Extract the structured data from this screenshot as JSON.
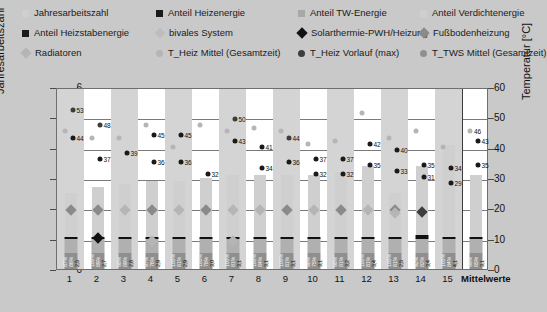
{
  "legend": {
    "rows": [
      [
        {
          "label": "Jahresarbeitszahl",
          "marker": "square",
          "color": "#cfcfcf",
          "name": "legend-jahresarbeitszahl"
        },
        {
          "label": "Anteil Heizenergie",
          "marker": "square",
          "color": "#1a1a1a",
          "name": "legend-anteil-heizenergie"
        },
        {
          "label": "Anteil TW-Energie",
          "marker": "square",
          "color": "#a8a8a8",
          "name": "legend-anteil-tw-energie"
        },
        {
          "label": "Anteil Verdichtenergie",
          "marker": "square",
          "color": "#cfcfcf",
          "name": "legend-anteil-verdichtenergie"
        }
      ],
      [
        {
          "label": "Anteil Heizstabenergie",
          "marker": "square",
          "color": "#1a1a1a",
          "name": "legend-anteil-heizstabenergie"
        },
        {
          "label": "bivales System",
          "marker": "diamond",
          "color": "#bdbdbd",
          "name": "legend-bivales-system"
        },
        {
          "label": "Solarthermie-PWH/Heizung",
          "marker": "diamond",
          "color": "#111111",
          "name": "legend-solarthermie"
        },
        {
          "label": "Fußbodenheizung",
          "marker": "diamond",
          "color": "#8a8a8a",
          "name": "legend-fussbodenheizung"
        }
      ],
      [
        {
          "label": "Radiatoren",
          "marker": "diamond",
          "color": "#b5b5b5",
          "name": "legend-radiatoren"
        },
        {
          "label": "T_Heiz Mittel (Gesamtzeit)",
          "marker": "circle",
          "color": "#b5b5b5",
          "name": "legend-t-heiz-mittel"
        },
        {
          "label": "T_Heiz Vorlauf (max)",
          "marker": "circle",
          "color": "#3d3d3d",
          "name": "legend-t-heiz-vorlauf-max"
        },
        {
          "label": "T_TWS Mittel (Gesamtzeit)",
          "marker": "circle",
          "color": "#8f8f8f",
          "name": "legend-t-tws-mittel"
        }
      ]
    ]
  },
  "axes": {
    "left_title": "Jahresarbeitszahl",
    "right_title": "Temperatur [°C]",
    "left_ticks": [
      "0",
      "1",
      "2",
      "3",
      "4",
      "5",
      "6"
    ],
    "right_ticks": [
      "0",
      "10",
      "20",
      "30",
      "40",
      "50",
      "60"
    ],
    "left_range": [
      0,
      6
    ],
    "right_range": [
      0,
      60
    ]
  },
  "chart_data": {
    "type": "bar",
    "title": "",
    "xlabel": "",
    "ylabel": "Jahresarbeitszahl",
    "y2label": "Temperatur [°C]",
    "ylim": [
      0,
      6
    ],
    "y2lim": [
      0,
      60
    ],
    "grid": true,
    "legend_position": "top",
    "categories": [
      "1",
      "2",
      "3",
      "4",
      "5",
      "6",
      "7",
      "8",
      "9",
      "10",
      "11",
      "12",
      "13",
      "14",
      "15",
      "Mittelwerte"
    ],
    "series": [
      {
        "name": "Jahresarbeitszahl",
        "axis": "left",
        "values": [
          2.5,
          2.7,
          2.8,
          2.9,
          2.9,
          3.0,
          3.1,
          3.1,
          3.1,
          3.1,
          3.2,
          3.4,
          2.5,
          3.4,
          4.1,
          3.1
        ]
      },
      {
        "name": "Anteil Heizenergie",
        "axis": "left_pct",
        "values": [
          "87%",
          "100%",
          "98%",
          "97%",
          "100%",
          "100%",
          "100%",
          "100%",
          "100%",
          "98%",
          "98%",
          "100%",
          "100%",
          "92%",
          "100%",
          "99%"
        ]
      },
      {
        "name": "Anteil TW-Energie",
        "axis": "left_pct",
        "values": [
          "86%",
          "89%",
          "89%",
          "76%",
          "81%",
          "78%",
          "81%",
          "84%",
          "81%",
          "75%",
          "81%",
          "81%",
          "81%",
          "82%",
          "84%",
          "85%"
        ]
      },
      {
        "name": "T_Heiz Vorlauf (max)",
        "axis": "right",
        "values": [
          53,
          52,
          null,
          45,
          45,
          null,
          50,
          41,
          44,
          37,
          37,
          42,
          40,
          35,
          34,
          43
        ]
      },
      {
        "name": "T_Heiz Mittel (Gesamtzeit)",
        "axis": "right",
        "values": [
          44,
          37,
          39,
          36,
          36,
          32,
          43,
          34,
          36,
          32,
          32,
          35,
          33,
          31,
          29,
          35
        ]
      },
      {
        "name": "T_TWS Mittel (Gesamtzeit)",
        "axis": "right",
        "values": [
          46,
          48,
          null,
          null,
          null,
          null,
          null,
          null,
          null,
          null,
          null,
          null,
          null,
          null,
          null,
          46
        ]
      }
    ]
  },
  "columns": [
    {
      "x": "1",
      "jaz": 2.5,
      "jaz_label": "2,5",
      "p1": "87%",
      "p2": "86%",
      "dots": [
        {
          "v": 53,
          "c": "#3d3d3d",
          "label": "53",
          "side": "right"
        },
        {
          "v": 44,
          "c": "#1a1a1a",
          "label": "44",
          "side": "right"
        },
        {
          "v": 46,
          "c": "#b5b5b5",
          "label": "",
          "side": "left"
        }
      ],
      "dia": {
        "v": 2.0,
        "c": "#8a8a8a"
      },
      "cap": false
    },
    {
      "x": "2",
      "jaz": 2.7,
      "jaz_label": "2,7",
      "p1": "100%",
      "p2": "89%",
      "dots": [
        {
          "v": 48,
          "c": "#3d3d3d",
          "label": "48",
          "side": "right"
        },
        {
          "v": 37,
          "c": "#1a1a1a",
          "label": "37",
          "side": "right"
        },
        {
          "v": 44,
          "c": "#b5b5b5",
          "label": "",
          "side": "left"
        }
      ],
      "dia": {
        "v": 2.0,
        "c": "#8a8a8a"
      },
      "dia2": {
        "v": 1.1,
        "c": "#111111"
      },
      "cap": false
    },
    {
      "x": "3",
      "jaz": 2.8,
      "jaz_label": "2,8",
      "p1": "98%",
      "p2": "89%",
      "dots": [
        {
          "v": 39,
          "c": "#1a1a1a",
          "label": "39",
          "side": "right"
        },
        {
          "v": 44,
          "c": "#b5b5b5",
          "label": "",
          "side": "left"
        }
      ],
      "dia": {
        "v": 2.0,
        "c": "#b5b5b5"
      },
      "cap": true
    },
    {
      "x": "4",
      "jaz": 2.9,
      "jaz_label": "2,9",
      "p1": "97%",
      "p2": "76%",
      "dots": [
        {
          "v": 45,
          "c": "#1a1a1a",
          "label": "45",
          "side": "right"
        },
        {
          "v": 36,
          "c": "#1a1a1a",
          "label": "36",
          "side": "right"
        },
        {
          "v": 48,
          "c": "#b5b5b5",
          "label": "",
          "side": "left"
        }
      ],
      "dia": {
        "v": 2.0,
        "c": "#8a8a8a"
      },
      "dia2": {
        "v": 1.0,
        "c": "#b5b5b5"
      },
      "cap": true
    },
    {
      "x": "5",
      "jaz": 2.9,
      "jaz_label": "2,9",
      "p1": "100%",
      "p2": "81%",
      "dots": [
        {
          "v": 45,
          "c": "#1a1a1a",
          "label": "45",
          "side": "right"
        },
        {
          "v": 36,
          "c": "#1a1a1a",
          "label": "36",
          "side": "right"
        },
        {
          "v": 41,
          "c": "#b5b5b5",
          "label": "",
          "side": "left"
        }
      ],
      "dia": {
        "v": 2.0,
        "c": "#b5b5b5"
      },
      "cap": true
    },
    {
      "x": "6",
      "jaz": 3.0,
      "jaz_label": "3,0",
      "p1": "100%",
      "p2": "78%",
      "dots": [
        {
          "v": 48,
          "c": "#b5b5b5",
          "label": "",
          "side": "left"
        },
        {
          "v": 32,
          "c": "#1a1a1a",
          "label": "32",
          "side": "right"
        }
      ],
      "dia": {
        "v": 2.0,
        "c": "#8a8a8a"
      },
      "cap": true
    },
    {
      "x": "7",
      "jaz": 3.1,
      "jaz_label": "3,1",
      "p1": "100%",
      "p2": "81%",
      "dots": [
        {
          "v": 50,
          "c": "#3d3d3d",
          "label": "50",
          "side": "right"
        },
        {
          "v": 43,
          "c": "#1a1a1a",
          "label": "43",
          "side": "right"
        },
        {
          "v": 46,
          "c": "#b5b5b5",
          "label": "",
          "side": "left"
        }
      ],
      "dia": {
        "v": 2.0,
        "c": "#b5b5b5"
      },
      "dia2": {
        "v": 1.0,
        "c": "#b5b5b5"
      },
      "cap": true
    },
    {
      "x": "8",
      "jaz": 3.1,
      "jaz_label": "3,1",
      "p1": "100%",
      "p2": "84%",
      "dots": [
        {
          "v": 41,
          "c": "#1a1a1a",
          "label": "41",
          "side": "right"
        },
        {
          "v": 34,
          "c": "#1a1a1a",
          "label": "34",
          "side": "right"
        },
        {
          "v": 47,
          "c": "#b5b5b5",
          "label": "",
          "side": "left"
        }
      ],
      "dia": {
        "v": 2.0,
        "c": "#b5b5b5"
      },
      "cap": true
    },
    {
      "x": "9",
      "jaz": 3.1,
      "jaz_label": "3,1",
      "p1": "100%",
      "p2": "81%",
      "dots": [
        {
          "v": 44,
          "c": "#3d3d3d",
          "label": "44",
          "side": "right"
        },
        {
          "v": 36,
          "c": "#1a1a1a",
          "label": "36",
          "side": "right"
        },
        {
          "v": 46,
          "c": "#b5b5b5",
          "label": "",
          "side": "left"
        }
      ],
      "dia": {
        "v": 2.0,
        "c": "#8a8a8a"
      },
      "cap": true
    },
    {
      "x": "10",
      "jaz": 3.1,
      "jaz_label": "3,1",
      "p1": "98%",
      "p2": "75%",
      "dots": [
        {
          "v": 37,
          "c": "#1a1a1a",
          "label": "37",
          "side": "right"
        },
        {
          "v": 32,
          "c": "#1a1a1a",
          "label": "32",
          "side": "right"
        },
        {
          "v": 42,
          "c": "#b5b5b5",
          "label": "",
          "side": "left"
        }
      ],
      "dia": {
        "v": 2.0,
        "c": "#b5b5b5"
      },
      "cap": true
    },
    {
      "x": "11",
      "jaz": 3.2,
      "jaz_label": "3,2",
      "p1": "98%",
      "p2": "81%",
      "dots": [
        {
          "v": 37,
          "c": "#1a1a1a",
          "label": "37",
          "side": "right"
        },
        {
          "v": 32,
          "c": "#1a1a1a",
          "label": "32",
          "side": "right"
        },
        {
          "v": 43,
          "c": "#b5b5b5",
          "label": "",
          "side": "left"
        }
      ],
      "dia": {
        "v": 2.0,
        "c": "#8a8a8a"
      },
      "cap": true
    },
    {
      "x": "12",
      "jaz": 3.4,
      "jaz_label": "3,4",
      "p1": "100%",
      "p2": "81%",
      "dots": [
        {
          "v": 42,
          "c": "#1a1a1a",
          "label": "42",
          "side": "right"
        },
        {
          "v": 35,
          "c": "#1a1a1a",
          "label": "35",
          "side": "right"
        },
        {
          "v": 52,
          "c": "#b5b5b5",
          "label": "",
          "side": "left"
        }
      ],
      "dia": {
        "v": 2.0,
        "c": "#b5b5b5"
      },
      "cap": true
    },
    {
      "x": "13",
      "jaz": 2.5,
      "jaz_label": "2,5",
      "p1": "100%",
      "p2": "81%",
      "dots": [
        {
          "v": 40,
          "c": "#1a1a1a",
          "label": "40",
          "side": "right"
        },
        {
          "v": 33,
          "c": "#1a1a1a",
          "label": "33",
          "side": "right"
        },
        {
          "v": 44,
          "c": "#b5b5b5",
          "label": "",
          "side": "left"
        }
      ],
      "dia": {
        "v": 2.0,
        "c": "#8a8a8a"
      },
      "dia2": {
        "v": 1.9,
        "c": "#b5b5b5"
      },
      "cap": true
    },
    {
      "x": "14",
      "jaz": 3.4,
      "jaz_label": "3,4",
      "p1": "92%",
      "p2": "82%",
      "dots": [
        {
          "v": 35,
          "c": "#1a1a1a",
          "label": "35",
          "side": "right"
        },
        {
          "v": 31,
          "c": "#1a1a1a",
          "label": "31",
          "side": "right"
        },
        {
          "v": 46,
          "c": "#b5b5b5",
          "label": "",
          "side": "left"
        }
      ],
      "dia": {
        "v": 1.95,
        "c": "#3d3d3d"
      },
      "cap": true,
      "cap_black": true
    },
    {
      "x": "15",
      "jaz": 4.1,
      "jaz_label": "4,1",
      "p1": "100%",
      "p2": "84%",
      "dots": [
        {
          "v": 34,
          "c": "#1a1a1a",
          "label": "34",
          "side": "right"
        },
        {
          "v": 29,
          "c": "#1a1a1a",
          "label": "29",
          "side": "right"
        },
        {
          "v": 41,
          "c": "#b5b5b5",
          "label": "",
          "side": "left"
        }
      ],
      "dia": null,
      "cap": true
    },
    {
      "x": "Mittelwerte",
      "jaz": 3.1,
      "jaz_label": "3,1",
      "p1": "99%",
      "p2": "85%",
      "dots": [
        {
          "v": 46,
          "c": "#b5b5b5",
          "label": "46",
          "side": "left"
        },
        {
          "v": 43,
          "c": "#1a1a1a",
          "label": "43",
          "side": "right"
        },
        {
          "v": 35,
          "c": "#1a1a1a",
          "label": "35",
          "side": "right"
        }
      ],
      "dia": null,
      "cap": true
    }
  ],
  "colors": {
    "background": "#c9c9c9",
    "plot_bg": "#ffffff",
    "band": "#d4d4d4",
    "bar_jaz": "#cfcfcf",
    "bar_heiz": "#8f8f8f",
    "bar_tw": "#b0b0b0",
    "grid": "#7a7a7a"
  }
}
